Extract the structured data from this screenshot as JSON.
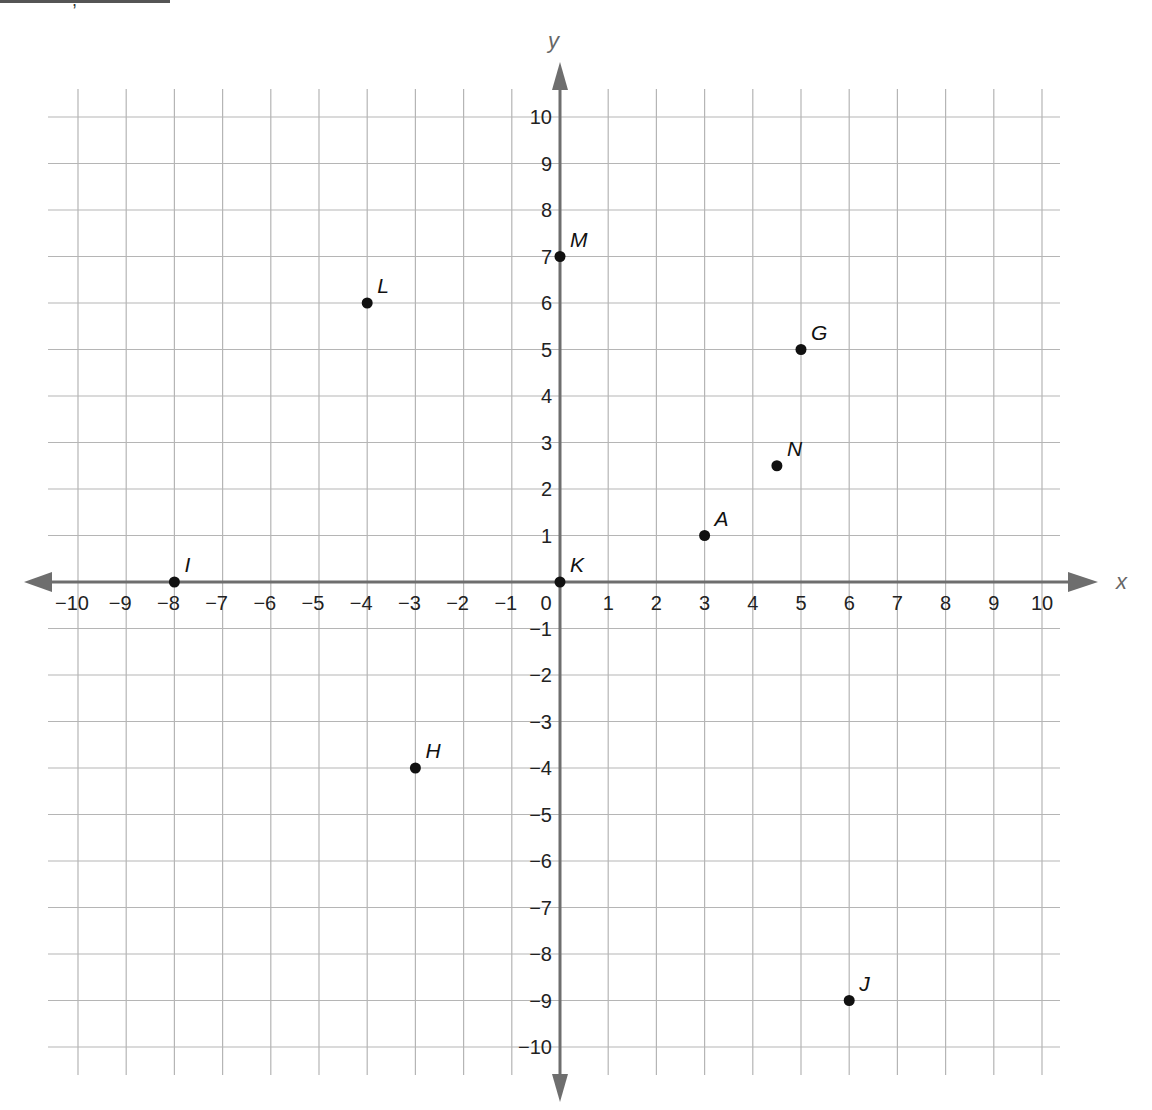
{
  "header_fragment": ",",
  "chart_data": {
    "type": "scatter",
    "title": "",
    "xlabel": "x",
    "ylabel": "y",
    "xlim": [
      -10,
      10
    ],
    "ylim": [
      -10,
      10
    ],
    "grid": true,
    "x_ticks": [
      -10,
      -9,
      -8,
      -7,
      -6,
      -5,
      -4,
      -3,
      -2,
      -1,
      0,
      1,
      2,
      3,
      4,
      5,
      6,
      7,
      8,
      9,
      10
    ],
    "y_ticks": [
      -10,
      -9,
      -8,
      -7,
      -6,
      -5,
      -4,
      -3,
      -2,
      -1,
      1,
      2,
      3,
      4,
      5,
      6,
      7,
      8,
      9,
      10
    ],
    "points": [
      {
        "label": "A",
        "x": 3,
        "y": 1
      },
      {
        "label": "G",
        "x": 5,
        "y": 5
      },
      {
        "label": "H",
        "x": -3,
        "y": -4
      },
      {
        "label": "I",
        "x": -8,
        "y": 0
      },
      {
        "label": "J",
        "x": 6,
        "y": -9
      },
      {
        "label": "K",
        "x": 0,
        "y": 0
      },
      {
        "label": "L",
        "x": -4,
        "y": 6
      },
      {
        "label": "M",
        "x": 0,
        "y": 7
      },
      {
        "label": "N",
        "x": 4.5,
        "y": 2.5
      }
    ]
  },
  "colors": {
    "grid": "#b5b5b5",
    "axis": "#6e6e6e",
    "point": "#111111",
    "text": "#222222"
  }
}
